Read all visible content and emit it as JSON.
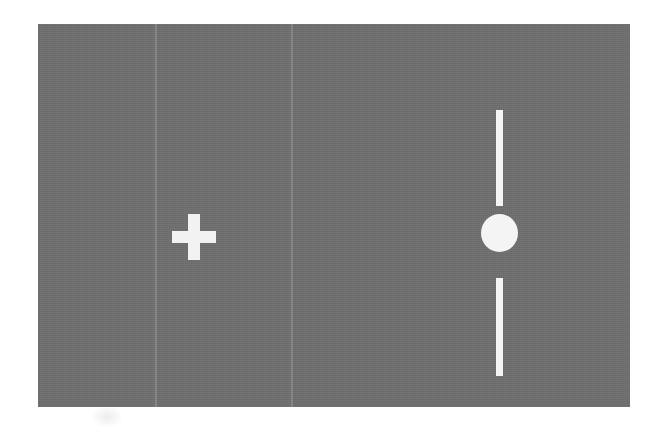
{
  "figure": {
    "kind": "visual-psychophysics-stimulus-display",
    "caption": "",
    "background_color": "#ffffff"
  },
  "panel": {
    "name": "stimulus-field",
    "background_color": "#6f6f6f",
    "left": 38,
    "top": 24,
    "width": 592,
    "height": 383,
    "texture": "scanned paper grain",
    "seams": [
      {
        "label": "scan-seam-1",
        "x": 155,
        "color": "#8a8a8a"
      },
      {
        "label": "scan-seam-2",
        "x": 291,
        "color": "#8a8a8a"
      }
    ]
  },
  "stimuli": {
    "fixation_cross": {
      "label": "fixation cross",
      "symbol": "+",
      "color": "#f2f2f2",
      "center_x": 156,
      "center_y": 213,
      "arm_length": 44,
      "stroke_width": 12
    },
    "line_disc": {
      "label": "vertical line with occluding disc",
      "color": "#f4f4f4",
      "center_x": 461,
      "line_top": 86,
      "line_bottom": 352,
      "line_width": 7,
      "upper_segment_length": 96,
      "lower_segment_length": 98,
      "gap_length": 72,
      "disc": {
        "label": "disc",
        "color": "#f4f4f4",
        "center_x": 461,
        "center_y": 209,
        "diameter": 37
      }
    }
  },
  "artifact": {
    "label": "faint page smudge",
    "visible": true
  }
}
